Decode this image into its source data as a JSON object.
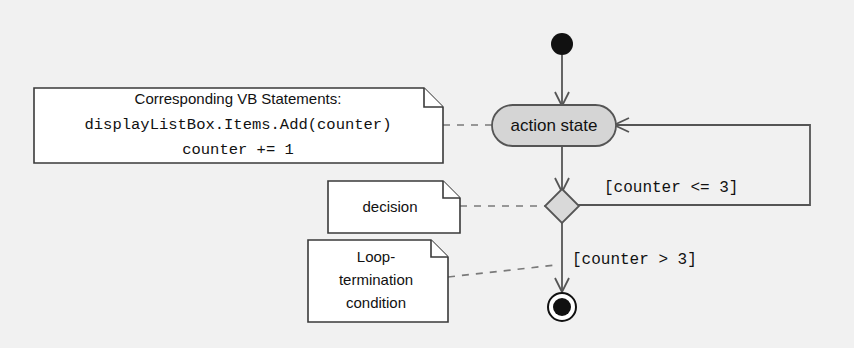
{
  "diagram": {
    "type": "uml-activity-diagram",
    "background_color": "#f1f1f1",
    "nodes": {
      "initial_state": {
        "name": "initial-state",
        "shape": "filled-circle",
        "color": "#111111"
      },
      "action_state": {
        "name": "action-state",
        "label": "action state",
        "shape": "rounded-rectangle",
        "fill": "#d5d5d5",
        "stroke": "#555555"
      },
      "decision": {
        "name": "decision-node",
        "shape": "diamond",
        "fill": "#d9d9d9",
        "stroke": "#555555"
      },
      "final_state": {
        "name": "final-state",
        "shape": "bullseye",
        "color": "#111111"
      }
    },
    "notes": {
      "vb_statements": {
        "name": "note-vb-statements",
        "lines": [
          "Corresponding VB Statements:",
          "displayListBox.Items.Add(counter)",
          "counter += 1"
        ]
      },
      "decision_note": {
        "name": "note-decision",
        "lines": [
          "decision"
        ]
      },
      "loop_termination_note": {
        "name": "note-loop-termination",
        "lines": [
          "Loop-",
          "termination",
          "condition"
        ]
      }
    },
    "guards": {
      "loop_back": "[counter <= 3]",
      "exit": "[counter > 3]"
    }
  }
}
